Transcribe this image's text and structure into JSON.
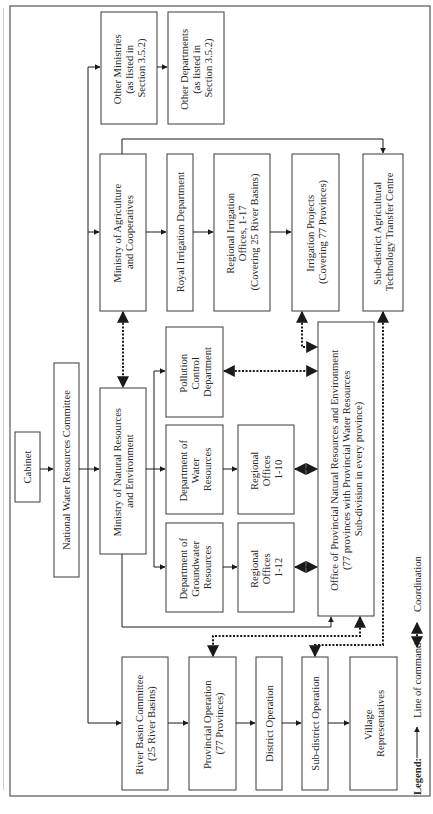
{
  "diagram": {
    "nodes": {
      "cabinet": [
        "Cabinet"
      ],
      "nwrc": [
        "National Water Resources Committee"
      ],
      "mnre": [
        "Ministry of Natural Resources",
        "and Environment"
      ],
      "other_ministries": [
        "Other Ministries",
        "(as listed in",
        "Section 3.5.2)"
      ],
      "other_departments": [
        "Other Departments",
        "(as listed in",
        "Section 3.5.2)"
      ],
      "moac": [
        "Ministry of Agriculture",
        "and Cooperatives"
      ],
      "royal_irrigation": [
        "Royal Irrigation Department"
      ],
      "regional_irrigation": [
        "Regional Irrigation",
        "Offices, 1-17",
        "(Covering 25 River Basins)"
      ],
      "irrigation_projects": [
        "Irrigation Projects",
        "(Covering 77 Provinces)"
      ],
      "subdistrict_agri": [
        "Sub-district Agricultural",
        "Technology Transfer Centre"
      ],
      "pollution_control": [
        "Pollution",
        "Control",
        "Department"
      ],
      "dept_water": [
        "Department of",
        "Water",
        "Resources"
      ],
      "dept_groundwater": [
        "Department of",
        "Groundwater",
        "Resources"
      ],
      "regional_offices_10": [
        "Regional",
        "Offices",
        "1-10"
      ],
      "regional_offices_12": [
        "Regional",
        "Offices",
        "1-12"
      ],
      "provincial_office": [
        "Office of Provincial Natural Resources and Environment",
        "(77 provinces with Provincial Water Resources",
        "Sub-division in every province)"
      ],
      "river_basin": [
        "River Basin Committee",
        "(25 River Basins)"
      ],
      "provincial_op": [
        "Provincial Operation",
        "(77 Provinces)"
      ],
      "district_op": [
        "District Operation"
      ],
      "subdistrict_op": [
        "Sub-district Operation"
      ],
      "village": [
        "Village",
        "Representatives"
      ]
    },
    "legend": {
      "title": "Legend:",
      "command_label": "Line of command",
      "coordination_label": "Coordination"
    }
  }
}
